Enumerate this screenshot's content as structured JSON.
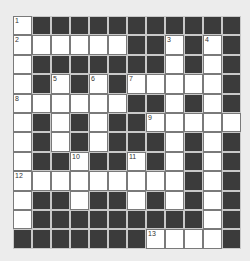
{
  "puzzle": {
    "rows": 12,
    "cols": 12,
    "colors": {
      "background": "#ececec",
      "block": "#3b3b3b",
      "open": "#ffffff"
    },
    "layout": [
      "W...........",
      "WWWWWW..W.W.",
      "W.......W.W.",
      "W.W.W.WWWWW.",
      "WWWWWW..W.W.",
      "W.W.W..WWWWW",
      "W.W.W...W.W.",
      "W..W..W.W.W.",
      "WWWWWWWWW.W.",
      "W..W..W.W.W.",
      "W.........W.",
      ".......WWWW."
    ],
    "numbers": [
      {
        "r": 0,
        "c": 0,
        "n": "1"
      },
      {
        "r": 1,
        "c": 0,
        "n": "2"
      },
      {
        "r": 1,
        "c": 8,
        "n": "3"
      },
      {
        "r": 1,
        "c": 10,
        "n": "4"
      },
      {
        "r": 3,
        "c": 2,
        "n": "5"
      },
      {
        "r": 3,
        "c": 4,
        "n": "6"
      },
      {
        "r": 3,
        "c": 6,
        "n": "7"
      },
      {
        "r": 4,
        "c": 0,
        "n": "8"
      },
      {
        "r": 5,
        "c": 7,
        "n": "9"
      },
      {
        "r": 7,
        "c": 3,
        "n": "10"
      },
      {
        "r": 7,
        "c": 6,
        "n": "11"
      },
      {
        "r": 8,
        "c": 0,
        "n": "12"
      },
      {
        "r": 11,
        "c": 7,
        "n": "13"
      }
    ]
  }
}
